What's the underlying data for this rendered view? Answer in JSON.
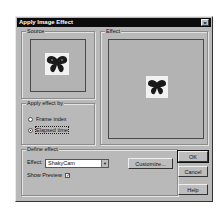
{
  "dialog": {
    "title": "Apply Image Effect",
    "close_glyph": "×"
  },
  "source": {
    "label": "Source"
  },
  "effect_panel": {
    "label": "Effect"
  },
  "apply_by": {
    "label": "Apply effect by",
    "options": [
      {
        "label": "Frame index",
        "checked": false
      },
      {
        "label": "Elapsed time",
        "checked": true
      }
    ]
  },
  "define_effect": {
    "label": "Define effect",
    "effect_label": "Effect:",
    "effect_value": "ShakyCam",
    "customize_label": "Customize...",
    "show_preview_label": "Show Preview",
    "show_preview_checked": true,
    "check_glyph": "✓",
    "dropdown_glyph": "▼"
  },
  "buttons": {
    "ok": "OK",
    "cancel": "Cancel",
    "help": "Help"
  },
  "colors": {
    "dialog_bg": "#b9b9b9",
    "titlebar_bg": "#0c0c0c",
    "titlebar_text": "#ffffff"
  }
}
